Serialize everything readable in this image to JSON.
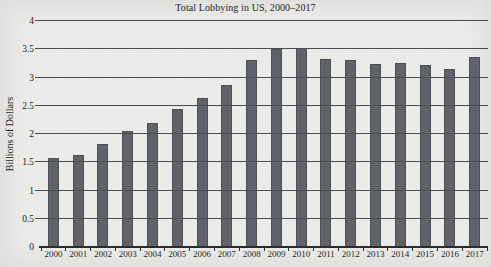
{
  "figure": {
    "title": "Total Lobbying in US, 2000–2017",
    "y_axis_title": "Billions of Dollars"
  },
  "chart_data": {
    "type": "bar",
    "title": "Total Lobbying in US, 2000–2017",
    "xlabel": "",
    "ylabel": "Billions of Dollars",
    "categories": [
      "2000",
      "2001",
      "2002",
      "2003",
      "2004",
      "2005",
      "2006",
      "2007",
      "2008",
      "2009",
      "2010",
      "2011",
      "2012",
      "2013",
      "2014",
      "2015",
      "2016",
      "2017"
    ],
    "values": [
      1.57,
      1.63,
      1.83,
      2.06,
      2.19,
      2.44,
      2.63,
      2.87,
      3.31,
      3.5,
      3.52,
      3.33,
      3.31,
      3.24,
      3.26,
      3.22,
      3.15,
      3.37
    ],
    "ylim": [
      0,
      4
    ],
    "ytick_labels_top_to_bottom": [
      "4",
      "3.5",
      "3",
      "2.5",
      "2",
      "1.5",
      "1",
      "0.5",
      "0"
    ],
    "grid": true,
    "legend": "none",
    "colors": {
      "bar": "#5f6267",
      "bar_edge": "#4c4f53",
      "gridline": "#4a4c4f",
      "axis": "#2a2b2e",
      "paper_background": "#ebece9",
      "text": "#1e1f21"
    }
  }
}
